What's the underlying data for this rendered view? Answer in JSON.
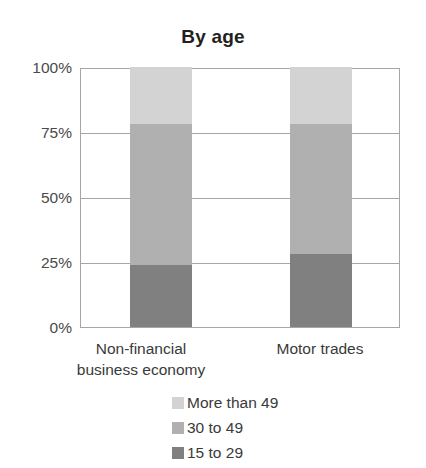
{
  "chart_data": {
    "type": "bar",
    "subtype": "stacked-100-percent",
    "title": "By age",
    "xlabel": "",
    "ylabel": "",
    "categories": [
      "Non-financial business economy",
      "Motor trades"
    ],
    "category_label_lines": [
      [
        "Non-financial",
        "business economy"
      ],
      [
        "Motor trades"
      ]
    ],
    "series": [
      {
        "name": "15 to 29",
        "values": [
          24,
          28
        ],
        "color": "#808080"
      },
      {
        "name": "30 to 49",
        "values": [
          54,
          50
        ],
        "color": "#b0b0b0"
      },
      {
        "name": "More than 49",
        "values": [
          22,
          22
        ],
        "color": "#d3d3d3"
      }
    ],
    "stack_order_bottom_to_top": [
      "15 to 29",
      "30 to 49",
      "More than 49"
    ],
    "ylim": [
      0,
      100
    ],
    "yticks": [
      0,
      25,
      50,
      75,
      100
    ],
    "ytick_labels": [
      "0%",
      "25%",
      "50%",
      "75%",
      "100%"
    ],
    "grid": true,
    "grid_axis": "y",
    "legend": {
      "position": "bottom",
      "entries": [
        {
          "label": "More than 49",
          "color": "#d3d3d3"
        },
        {
          "label": "30 to 49",
          "color": "#b0b0b0"
        },
        {
          "label": "15 to 29",
          "color": "#808080"
        }
      ]
    },
    "axis_color": "#a6a6a6",
    "background": "#ffffff"
  }
}
